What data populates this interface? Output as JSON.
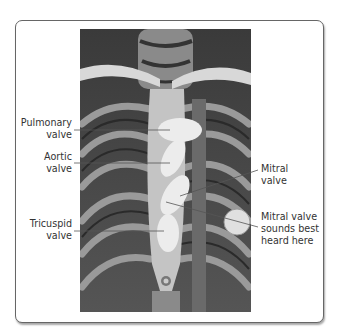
{
  "figure": {
    "labels": {
      "pulmonary": [
        "Pulmonary",
        "valve"
      ],
      "aortic": [
        "Aortic",
        "valve"
      ],
      "tricuspid": [
        "Tricuspid",
        "valve"
      ],
      "mitral": [
        "Mitral",
        "valve"
      ],
      "mitral_auscultation": [
        "Mitral valve",
        "sounds best",
        "heard here"
      ]
    }
  }
}
